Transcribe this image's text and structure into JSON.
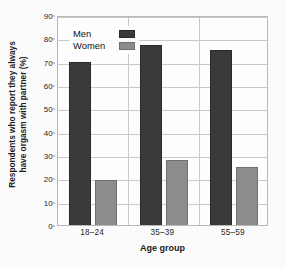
{
  "chart_data": {
    "type": "bar",
    "title": "",
    "categories": [
      "18–24",
      "35–39",
      "55–59"
    ],
    "series": [
      {
        "name": "Men",
        "values": [
          70,
          77,
          75
        ],
        "color": "#3a3a3a"
      },
      {
        "name": "Women",
        "values": [
          19.5,
          28,
          25
        ],
        "color": "#8c8c8c"
      }
    ],
    "xlabel": "Age group",
    "ylabel": "Respondents who report they always have orgasm with partner (%)",
    "ylabel_line1": "Respondents who report they always",
    "ylabel_line2": "have orgasm with partner (%)",
    "ylim": [
      0,
      90
    ],
    "ytick_labels": [
      "0",
      "10",
      "20",
      "30",
      "40",
      "50",
      "60",
      "70",
      "80",
      "90"
    ],
    "ytick_values": [
      0,
      10,
      20,
      30,
      40,
      50,
      60,
      70,
      80,
      90
    ],
    "grid": true,
    "legend_position": "top-left",
    "legend_entries": [
      "Men",
      "Women"
    ]
  },
  "legend": {
    "men_label": "Men",
    "women_label": "Women"
  },
  "axes": {
    "x_title": "Age group",
    "y_title_line1": "Respondents who report they always",
    "y_title_line2": "have orgasm with partner (%)"
  },
  "colors": {
    "men": "#3a3a3a",
    "women": "#8c8c8c",
    "grid": "#c9c9c9",
    "frame": "#b9b9b9",
    "background": "#fbfbfb"
  }
}
